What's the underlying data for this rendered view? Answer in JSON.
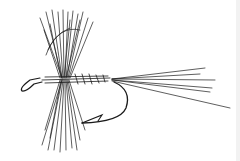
{
  "image": {
    "subject": "dry fly fishing fly illustration",
    "style": "black ink line drawing",
    "background": "#ffffff",
    "ink_color": "#1a1a1a"
  }
}
